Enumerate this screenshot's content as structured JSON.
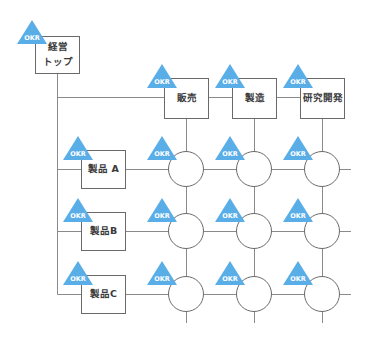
{
  "diagram": {
    "type": "matrix-organization",
    "colors": {
      "okr_badge": "#5aaee8",
      "line": "#8a8a8a",
      "box_border": "#6a6a6a",
      "text": "#3a3a3a"
    },
    "badge_label": "OKR",
    "top": {
      "label_line1": "経営",
      "label_line2": "トップ"
    },
    "functions": [
      {
        "label": "販売"
      },
      {
        "label": "製造"
      },
      {
        "label": "研究開発"
      }
    ],
    "products": [
      {
        "label": "製品 A"
      },
      {
        "label": "製品B"
      },
      {
        "label": "製品C"
      }
    ]
  }
}
